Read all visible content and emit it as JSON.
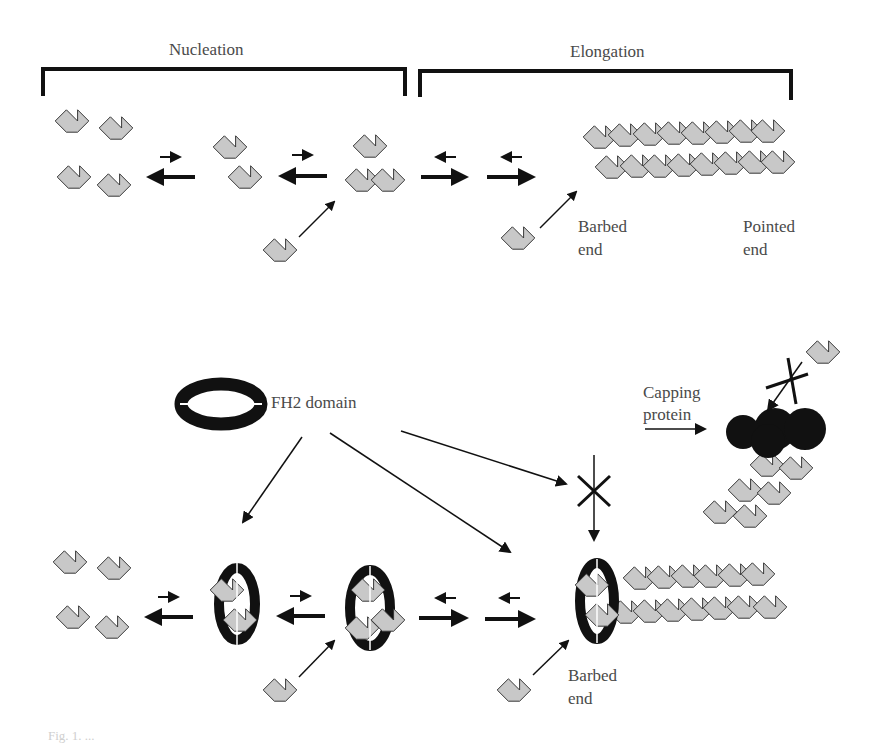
{
  "diagram": {
    "top_panel": {
      "phase_labels": [
        "Nucleation",
        "Elongation"
      ],
      "filament_end_labels": {
        "barbed": "Barbed\nend",
        "pointed": "Pointed\nend"
      }
    },
    "bottom_panel": {
      "fh2_label": "FH2 domain",
      "capping_label": "Capping\nprotein",
      "barbed_label": "Barbed\nend"
    },
    "caption": "Fig. 1. ...",
    "colors": {
      "monomer_fill": "#c8c8c8",
      "monomer_stroke": "#333333",
      "dark": "#111111"
    }
  },
  "labels": {
    "nucleation": "Nucleation",
    "elongation": "Elongation",
    "barbed_top_1": "Barbed",
    "barbed_top_2": "end",
    "pointed_1": "Pointed",
    "pointed_2": "end",
    "fh2": "FH2 domain",
    "capping_1": "Capping",
    "capping_2": "protein",
    "barbed_bot_1": "Barbed",
    "barbed_bot_2": "end"
  }
}
